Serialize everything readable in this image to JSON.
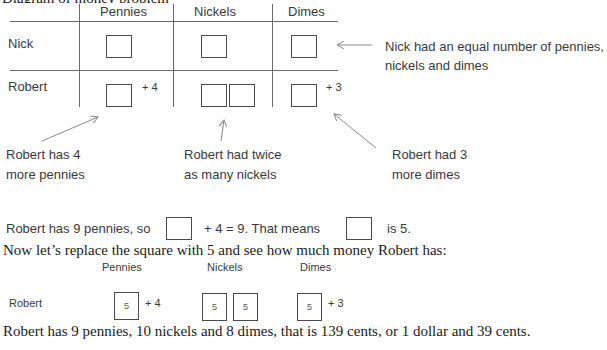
{
  "top_cut_text": "Diagram of money problem",
  "table": {
    "columns": [
      "Pennies",
      "Nickels",
      "Dimes"
    ],
    "rows": [
      {
        "name": "Nick",
        "pennies_extra": "",
        "dimes_extra": ""
      },
      {
        "name": "Robert",
        "pennies_extra": "+ 4",
        "dimes_extra": "+ 3"
      }
    ]
  },
  "annotations": {
    "nick_equal": [
      "Nick had an equal number of pennies,",
      "nickels and dimes"
    ],
    "robert_pennies": [
      "Robert has 4",
      "more pennies"
    ],
    "robert_nickels": [
      "Robert had twice",
      "as many nickels"
    ],
    "robert_dimes": [
      "Robert had 3",
      "more dimes"
    ]
  },
  "equation": {
    "part1": "Robert has 9 pennies, so",
    "part2": "+ 4 = 9. That means",
    "part3": "is 5."
  },
  "replace_sentence": "Now let’s replace the square with 5 and see how much money Robert has:",
  "solved": {
    "columns": [
      "Pennies",
      "Nickels",
      "Dimes"
    ],
    "row_label": "Robert",
    "box_value": "5",
    "pennies_extra": "+ 4",
    "dimes_extra": "+ 3"
  },
  "conclusion": "Robert has 9 pennies, 10 nickels and 8 dimes, that is 139 cents, or 1 dollar and 39 cents."
}
